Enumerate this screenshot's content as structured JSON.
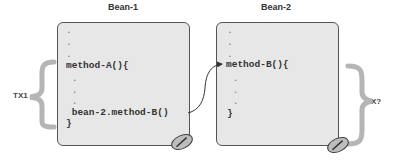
{
  "beans": [
    {
      "title": "Bean-1",
      "lines": [
        ".",
        ".",
        ".",
        "method-A(){",
        " .",
        " .",
        " .",
        " bean-2.method-B()",
        "}"
      ]
    },
    {
      "title": "Bean-2",
      "lines": [
        ".",
        ".",
        ".",
        "method-B(){",
        " .",
        " .",
        " .",
        "}"
      ]
    }
  ],
  "transactions": {
    "left": "TX1",
    "right": "TX?"
  },
  "colors": {
    "box_fill": "#e7e7e7",
    "box_border": "#555555",
    "brace": "#b5b5b5",
    "arrow": "#333333"
  }
}
